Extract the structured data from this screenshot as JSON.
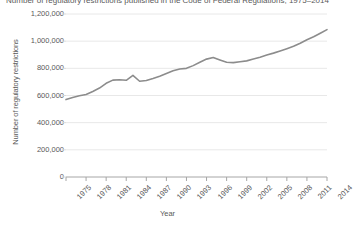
{
  "chart_data": {
    "type": "line",
    "title": "Number of regulatory restrictions published in the Code of Federal Regulations, 1975–2014",
    "xlabel": "Year",
    "ylabel": "Number of regulatory restrictions",
    "ylim": [
      0,
      1200000
    ],
    "ytick_labels": [
      "0",
      "200,000",
      "400,000",
      "600,000",
      "800,000",
      "1,000,000",
      "1,200,000"
    ],
    "ytick_values": [
      0,
      200000,
      400000,
      600000,
      800000,
      1000000,
      1200000
    ],
    "xtick_labels": [
      "1975",
      "1978",
      "1981",
      "1984",
      "1987",
      "1990",
      "1993",
      "1996",
      "1999",
      "2002",
      "2005",
      "2008",
      "2011",
      "2014"
    ],
    "xtick_values": [
      1975,
      1978,
      1981,
      1984,
      1987,
      1990,
      1993,
      1996,
      1999,
      2002,
      2005,
      2008,
      2011,
      2014
    ],
    "xlim": [
      1975,
      2014
    ],
    "grid": "horizontal",
    "legend": "none",
    "series": [
      {
        "name": "Regulatory restrictions",
        "color": "#8c8c8c",
        "x": [
          1975,
          1976,
          1977,
          1978,
          1979,
          1980,
          1981,
          1982,
          1983,
          1984,
          1985,
          1986,
          1987,
          1988,
          1989,
          1990,
          1991,
          1992,
          1993,
          1994,
          1995,
          1996,
          1997,
          1998,
          1999,
          2000,
          2001,
          2002,
          2003,
          2004,
          2005,
          2006,
          2007,
          2008,
          2009,
          2010,
          2011,
          2012,
          2013,
          2014
        ],
        "values": [
          570000,
          585000,
          598000,
          608000,
          630000,
          655000,
          690000,
          713000,
          716000,
          712000,
          748000,
          705000,
          710000,
          725000,
          742000,
          762000,
          782000,
          795000,
          800000,
          820000,
          845000,
          868000,
          880000,
          862000,
          845000,
          842000,
          848000,
          855000,
          868000,
          882000,
          898000,
          912000,
          928000,
          945000,
          962000,
          985000,
          1010000,
          1032000,
          1058000,
          1085000
        ]
      }
    ]
  }
}
